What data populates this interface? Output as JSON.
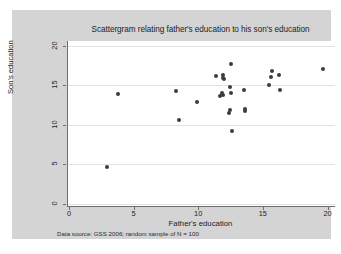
{
  "figure": {
    "title": "Scattergram relating father's education to his son's education",
    "note": "Data source: GSS 2006; random sample of N = 100",
    "background_color": "#d4d4d4",
    "plot_background_color": "#ffffff",
    "marker_color": "#3b3b46",
    "axis_color": "#6e6e6e",
    "grid_color": "#e2e2e2"
  },
  "chart_data": {
    "type": "scatter",
    "title": "Scattergram relating father's education to his son's education",
    "xlabel": "Father's education",
    "ylabel": "Son's education",
    "note": "Data source: GSS 2006; random sample of N = 100",
    "xlim": [
      -0.15,
      20.5
    ],
    "ylim": [
      -0.3,
      20.6
    ],
    "xticks": [
      0,
      5,
      10,
      15,
      20
    ],
    "yticks": [
      0,
      5,
      10,
      15,
      20
    ],
    "xtick_labels": [
      "0",
      "5",
      "10",
      "15",
      "20"
    ],
    "ytick_labels": [
      "0",
      "5",
      "10",
      "15",
      "20"
    ],
    "grid": "horizontal",
    "legend": "none",
    "marker": "filled-circle",
    "series": [
      {
        "name": "father-son education pairs",
        "points": [
          [
            2.9,
            4.6
          ],
          [
            3.7,
            13.85
          ],
          [
            8.2,
            14.25
          ],
          [
            8.4,
            10.6
          ],
          [
            9.8,
            12.85
          ],
          [
            11.3,
            16.2
          ],
          [
            11.85,
            16.35
          ],
          [
            11.85,
            15.95
          ],
          [
            11.9,
            15.75
          ],
          [
            12.45,
            17.75
          ],
          [
            12.4,
            14.8
          ],
          [
            11.75,
            14.05
          ],
          [
            11.85,
            13.8
          ],
          [
            11.6,
            13.65
          ],
          [
            12.45,
            14.0
          ],
          [
            12.35,
            11.8
          ],
          [
            12.3,
            11.45
          ],
          [
            12.5,
            9.15
          ],
          [
            13.45,
            14.4
          ],
          [
            13.55,
            11.95
          ],
          [
            13.55,
            11.7
          ],
          [
            15.4,
            15.05
          ],
          [
            15.6,
            16.8
          ],
          [
            15.55,
            16.1
          ],
          [
            16.15,
            16.35
          ],
          [
            16.25,
            14.45
          ],
          [
            19.6,
            17.05
          ]
        ]
      }
    ]
  }
}
